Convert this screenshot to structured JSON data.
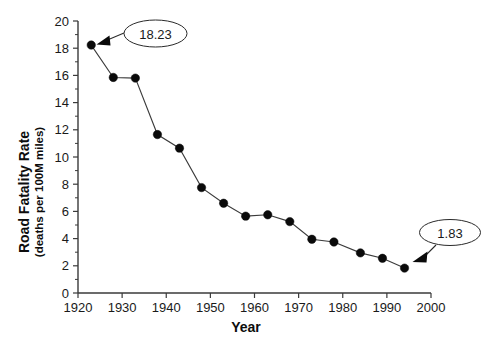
{
  "chart_data": {
    "type": "line",
    "title": "",
    "xlabel": "Year",
    "ylabel": "Road Fatality Rate",
    "ylabel_sub": "(deaths per 100M miles)",
    "xlim": [
      1920,
      2000
    ],
    "ylim": [
      0,
      20
    ],
    "xticks": [
      1920,
      1930,
      1940,
      1950,
      1960,
      1970,
      1980,
      1990,
      2000
    ],
    "xtick_labels": [
      "1920",
      "1930",
      "1940",
      "1950",
      "1960",
      "1970",
      "1980",
      "1990",
      "2000"
    ],
    "yticks": [
      0,
      2,
      4,
      6,
      8,
      10,
      12,
      14,
      16,
      18,
      20
    ],
    "ytick_labels": [
      "0",
      "2",
      "4",
      "6",
      "8",
      "10",
      "12",
      "14",
      "16",
      "18",
      "20"
    ],
    "minor_yticks": [
      1,
      3,
      5,
      7,
      9,
      11,
      13,
      15,
      17,
      19
    ],
    "grid": false,
    "legend": "none",
    "marker": "filled-circle",
    "x": [
      1923,
      1928,
      1933,
      1938,
      1943,
      1948,
      1953,
      1958,
      1963,
      1968,
      1973,
      1978,
      1984,
      1989,
      1994
    ],
    "values": [
      18.23,
      15.85,
      15.8,
      11.65,
      10.65,
      7.75,
      6.6,
      5.65,
      5.75,
      5.25,
      3.95,
      3.75,
      2.95,
      2.55,
      1.83
    ],
    "annotations": [
      {
        "label": "18.23",
        "target_x": 1923,
        "target_y": 18.23,
        "position": "upper-right"
      },
      {
        "label": "1.83",
        "target_x": 1994,
        "target_y": 1.83,
        "position": "right"
      }
    ]
  },
  "axes": {
    "y_title": "Road Fatality Rate",
    "y_subtitle": "(deaths per 100M miles)",
    "x_title": "Year"
  }
}
